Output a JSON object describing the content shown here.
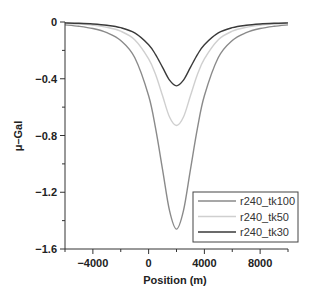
{
  "chart_data": {
    "type": "line",
    "title": "",
    "xlabel": "Position (m)",
    "ylabel": "μ–Gal",
    "xlim": [
      -6000,
      10000
    ],
    "ylim": [
      -1.6,
      0
    ],
    "x_ticks": [
      -4000,
      0,
      4000,
      8000
    ],
    "x_tick_labels": [
      "−4000",
      "0",
      "4000",
      "8000"
    ],
    "x_minor_ticks": [
      -6000,
      -2000,
      2000,
      6000,
      10000
    ],
    "y_ticks": [
      0,
      -0.4,
      -0.8,
      -1.2,
      -1.6
    ],
    "y_tick_labels": [
      "0",
      "−0.4",
      "−0.8",
      "−1.2",
      "−1.6"
    ],
    "y_minor_ticks": [
      -0.2,
      -0.6,
      -1.0,
      -1.4
    ],
    "grid": false,
    "legend_position": "lower right",
    "x": [
      -6000,
      -5000,
      -4000,
      -3000,
      -2000,
      -1000,
      0,
      500,
      1000,
      1500,
      2000,
      2500,
      3000,
      3500,
      4000,
      5000,
      6000,
      7000,
      8000,
      9000,
      10000
    ],
    "series": [
      {
        "name": "r240_tk100",
        "color": "#8a8a8a",
        "values": [
          -0.02,
          -0.03,
          -0.046,
          -0.075,
          -0.13,
          -0.25,
          -0.52,
          -0.75,
          -1.04,
          -1.33,
          -1.46,
          -1.33,
          -1.04,
          -0.75,
          -0.52,
          -0.25,
          -0.13,
          -0.075,
          -0.046,
          -0.03,
          -0.02
        ]
      },
      {
        "name": "r240_tk50",
        "color": "#cfcfcf",
        "values": [
          -0.01,
          -0.015,
          -0.023,
          -0.037,
          -0.065,
          -0.125,
          -0.26,
          -0.37,
          -0.52,
          -0.67,
          -0.73,
          -0.67,
          -0.52,
          -0.37,
          -0.26,
          -0.125,
          -0.065,
          -0.037,
          -0.023,
          -0.015,
          -0.01
        ]
      },
      {
        "name": "r240_tk30",
        "color": "#3a3a3a",
        "values": [
          -0.006,
          -0.009,
          -0.014,
          -0.023,
          -0.04,
          -0.077,
          -0.16,
          -0.23,
          -0.32,
          -0.41,
          -0.45,
          -0.41,
          -0.32,
          -0.23,
          -0.16,
          -0.077,
          -0.04,
          -0.023,
          -0.014,
          -0.009,
          -0.006
        ]
      }
    ]
  }
}
